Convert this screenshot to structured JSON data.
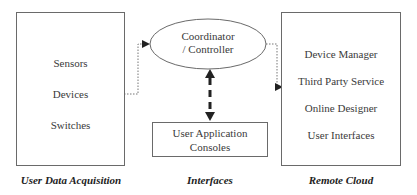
{
  "panels": {
    "user_data_acquisition": {
      "caption": "User Data Acquisition",
      "items": [
        "Sensors",
        "Devices",
        "Switches"
      ]
    },
    "interfaces": {
      "caption": "Interfaces",
      "coordinator": {
        "line1": "Coordinator",
        "line2": "/ Controller"
      },
      "console": {
        "line1": "User Application",
        "line2": "Consoles"
      }
    },
    "remote_cloud": {
      "caption": "Remote Cloud",
      "items": [
        "Device Manager",
        "Third Party Service",
        "Online Designer",
        "User Interfaces"
      ]
    }
  },
  "connectors": [
    {
      "from": "User Data Acquisition",
      "to": "Coordinator / Controller",
      "style": "dotted",
      "arrow": "end"
    },
    {
      "from": "Coordinator / Controller",
      "to": "Remote Cloud",
      "style": "dotted",
      "arrow": "end"
    },
    {
      "from": "Coordinator / Controller",
      "to": "User Application Consoles",
      "style": "dashed-bold",
      "arrow": "both"
    }
  ],
  "colors": {
    "line": "#6a6a6a",
    "bold_arrow": "#222222",
    "text": "#3a3a3a"
  }
}
